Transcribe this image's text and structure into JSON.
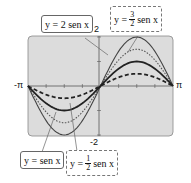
{
  "chart_data": {
    "type": "line",
    "title": "",
    "xlabel": "",
    "ylabel": "",
    "xlim": [
      "-π",
      "π"
    ],
    "ylim": [
      -2,
      2
    ],
    "x_tick_labels": [
      "-π",
      "π"
    ],
    "y_tick_labels": [
      "2",
      "-2"
    ],
    "grid": false,
    "series": [
      {
        "name": "y = 2 sen x",
        "amplitude": 2,
        "style": "solid thin"
      },
      {
        "name": "y = 3/2 sen x",
        "amplitude": 1.5,
        "style": "dotted"
      },
      {
        "name": "y = sen x",
        "amplitude": 1,
        "style": "solid thick"
      },
      {
        "name": "y = 1/2 sen x",
        "amplitude": 0.5,
        "style": "dashed"
      }
    ]
  },
  "labels": {
    "xmin": "-π",
    "xmax": "π",
    "ymax": "2",
    "ymin": "-2",
    "eq_2": "y = 2 sen x",
    "eq_32_pre": "y =",
    "eq_32_num": "3",
    "eq_32_den": "2",
    "eq_32_post": "sen x",
    "eq_1": "y = sen x",
    "eq_12_pre": "y =",
    "eq_12_num": "1",
    "eq_12_den": "2",
    "eq_12_post": "sen x"
  }
}
